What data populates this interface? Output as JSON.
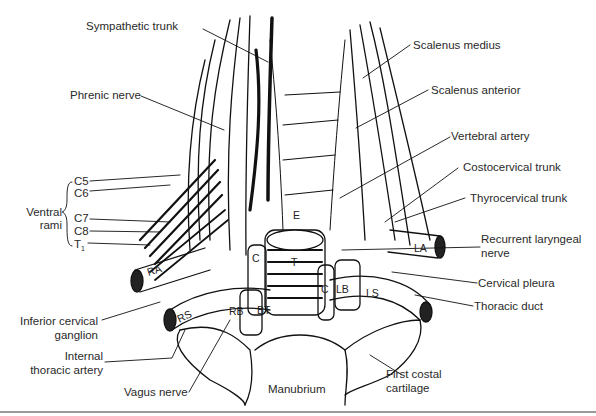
{
  "figure": {
    "type": "anatomical illustration"
  },
  "labels_left": {
    "sympathetic_trunk": "Sympathetic trunk",
    "phrenic_nerve": "Phrenic nerve",
    "ventral_rami_group": "Ventral rami",
    "ventral_rami_line1": "Ventral",
    "ventral_rami_line2": "rami",
    "rami": [
      "C5",
      "C6",
      "C7",
      "C8",
      "T"
    ],
    "t1_subscript": "1",
    "inferior_cervical_ganglion_line1": "Inferior cervical",
    "inferior_cervical_ganglion_line2": "ganglion",
    "internal_thoracic_artery_line1": "Internal",
    "internal_thoracic_artery_line2": "thoracic artery",
    "vagus_nerve": "Vagus nerve"
  },
  "labels_right": {
    "scalenus_medius": "Scalenus medius",
    "scalenus_anterior": "Scalenus anterior",
    "vertebral_artery": "Vertebral artery",
    "costocervical_trunk": "Costocervical trunk",
    "thyrocervical_trunk": "Thyrocervical trunk",
    "recurrent_laryngeal_line1": "Recurrent laryngeal",
    "recurrent_laryngeal_line2": "nerve",
    "cervical_pleura": "Cervical pleura",
    "thoracic_duct": "Thoracic duct",
    "first_costal_line1": "First costal",
    "first_costal_line2": "cartilage"
  },
  "labels_bottom": {
    "manubrium": "Manubrium"
  },
  "structure_abbreviations": {
    "RA": "RA",
    "LA": "LA",
    "RS": "RS",
    "RB": "RB",
    "BT": "BT",
    "LB": "LB",
    "LS": "LS",
    "C_right": "C",
    "C_left": "C",
    "T": "T",
    "E": "E"
  }
}
